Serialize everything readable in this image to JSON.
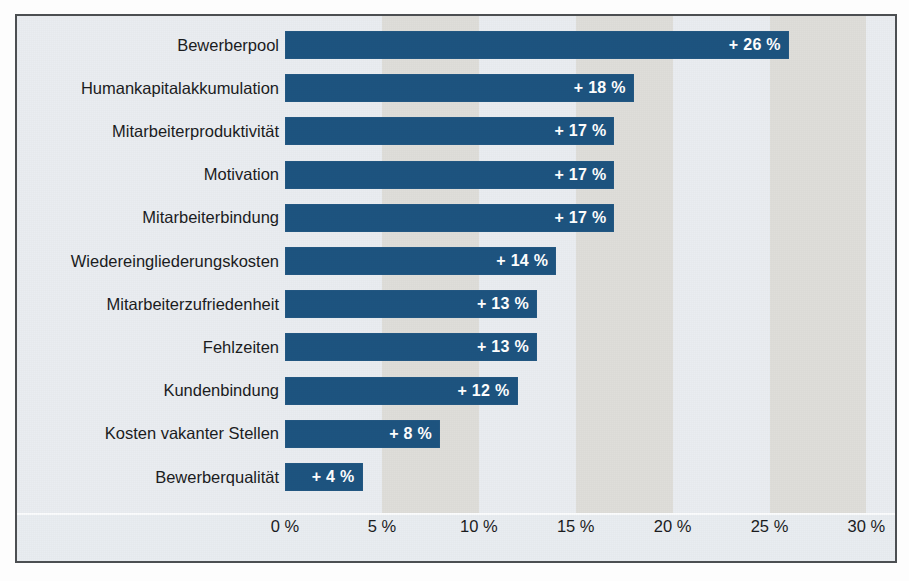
{
  "chart_data": {
    "type": "bar",
    "orientation": "horizontal",
    "title": "",
    "subtitle": "",
    "xlabel": "",
    "ylabel": "",
    "xlim": [
      0,
      30
    ],
    "xtick_labels": [
      "0 %",
      "5 %",
      "10 %",
      "15 %",
      "20 %",
      "25 %",
      "30 %"
    ],
    "xticks": [
      0,
      5,
      10,
      15,
      20,
      25,
      30
    ],
    "grid": false,
    "legend": null,
    "categories": [
      "Bewerberpool",
      "Humankapitalakkumulation",
      "Mitarbeiterproduktivität",
      "Motivation",
      "Mitarbeiterbindung",
      "Wiedereingliederungskosten",
      "Mitarbeiterzufriedenheit",
      "Fehlzeiten",
      "Kundenbindung",
      "Kosten vakanter Stellen",
      "Bewerberqualität"
    ],
    "values": [
      26,
      18,
      17,
      17,
      17,
      14,
      13,
      13,
      12,
      8,
      4
    ],
    "value_labels": [
      "+ 26 %",
      "+ 18 %",
      "+ 17 %",
      "+ 17 %",
      "+ 17 %",
      "+ 14 %",
      "+ 13 %",
      "+ 13 %",
      "+ 12 %",
      "+ 8 %",
      "+ 4 %"
    ],
    "colors": {
      "bar": "#1d5480",
      "value_text": "#ffffff",
      "category_text": "#1b1c1e",
      "plot_background": "#e9edf1",
      "band_shade": "#dfdeda",
      "frame_border": "#4c4f52",
      "axis_rule": "#fbfcfd"
    }
  }
}
